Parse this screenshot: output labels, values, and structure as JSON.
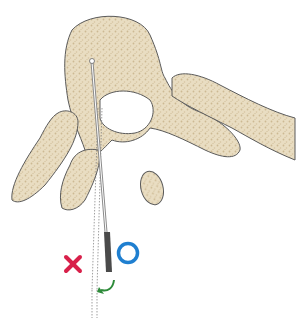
{
  "figure": {
    "colors": {
      "bone_fill": "#e8dcc0",
      "bone_texture": "#cbb894",
      "outline": "#5a5a5a",
      "needle": "#888888",
      "needle_hub": "#4a4a4a",
      "wrong_mark": "#d8204a",
      "correct_mark": "#1f7fd0",
      "arrow": "#2e8b3a"
    },
    "markers": {
      "wrong": {
        "symbol": "×",
        "meaning": "incorrect angle"
      },
      "correct": {
        "symbol": "○",
        "meaning": "correct angle"
      },
      "rotation_arrow": {
        "direction": "counter-clockwise"
      }
    }
  }
}
